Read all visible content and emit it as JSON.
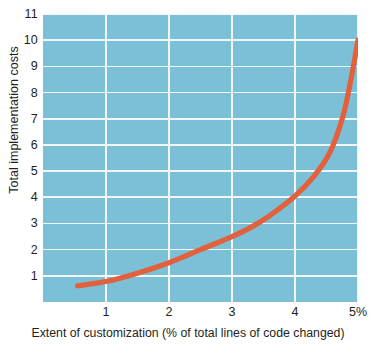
{
  "chart_data": {
    "type": "line",
    "title": "",
    "subtitle": "",
    "xlabel": "Extent of customization (% of total lines of code changed)",
    "ylabel": "Total implementation costs",
    "xlim": [
      0,
      5
    ],
    "ylim": [
      0,
      11
    ],
    "grid": true,
    "legend": null,
    "x_ticks": [
      {
        "value": 1,
        "label": "1"
      },
      {
        "value": 2,
        "label": "2"
      },
      {
        "value": 3,
        "label": "3"
      },
      {
        "value": 4,
        "label": "4"
      },
      {
        "value": 5,
        "label": "5%"
      }
    ],
    "y_ticks": [
      {
        "value": 1,
        "label": "1"
      },
      {
        "value": 2,
        "label": "2"
      },
      {
        "value": 3,
        "label": "3"
      },
      {
        "value": 4,
        "label": "4"
      },
      {
        "value": 5,
        "label": "5"
      },
      {
        "value": 6,
        "label": "6"
      },
      {
        "value": 7,
        "label": "7"
      },
      {
        "value": 8,
        "label": "8"
      },
      {
        "value": 9,
        "label": "9"
      },
      {
        "value": 10,
        "label": "10"
      },
      {
        "value": 11,
        "label": "11"
      }
    ],
    "series": [
      {
        "name": "Total implementation costs",
        "color": "#e2603c",
        "x": [
          0.55,
          1.0,
          1.5,
          2.0,
          2.5,
          3.0,
          3.3,
          3.6,
          4.0,
          4.3,
          4.55,
          4.75,
          4.88,
          5.0
        ],
        "values": [
          0.62,
          0.78,
          1.1,
          1.5,
          2.0,
          2.5,
          2.85,
          3.3,
          4.05,
          4.8,
          5.7,
          7.0,
          8.4,
          10.0
        ]
      }
    ],
    "colors": {
      "plot_background": "#7cc0d8",
      "gridline": "#f2f8fa",
      "curve": "#e2603c",
      "text": "#231f20",
      "page_background": "#ffffff"
    }
  }
}
